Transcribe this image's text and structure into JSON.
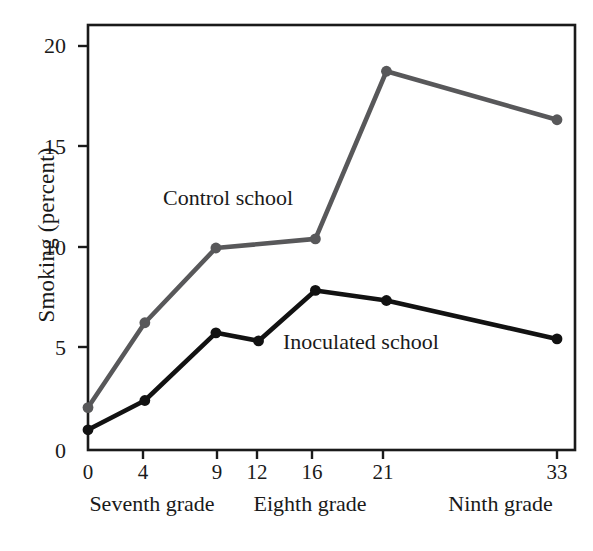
{
  "chart_data": {
    "type": "line",
    "title": "",
    "xlabel": "",
    "ylabel": "Smoking (percent)",
    "x": [
      0,
      4,
      9,
      12,
      16,
      21,
      33
    ],
    "xtick_labels": [
      "0",
      "4",
      "9",
      "12",
      "16",
      "21",
      "33"
    ],
    "ytick_labels": [
      "0",
      "5",
      "10",
      "15",
      "20"
    ],
    "yticks": [
      0,
      5,
      10,
      15,
      20
    ],
    "xlim": [
      0,
      34.3
    ],
    "ylim": [
      0,
      21.0
    ],
    "grid": false,
    "legend_position": "inline-annotation",
    "series": [
      {
        "name": "Control school",
        "color": "#58585a",
        "marker": "circle",
        "x": [
          0,
          4,
          9,
          16,
          21,
          33
        ],
        "values": [
          2.1,
          6.3,
          10.0,
          10.45,
          18.75,
          16.35
        ]
      },
      {
        "name": "Inoculated school",
        "color": "#121212",
        "marker": "circle",
        "x": [
          0,
          4,
          9,
          12,
          16,
          21,
          33
        ],
        "values": [
          1.0,
          2.45,
          5.8,
          5.4,
          7.9,
          7.4,
          5.5
        ]
      }
    ],
    "annotations": [
      {
        "text": "Control school",
        "x_px": 163,
        "y_px": 186
      },
      {
        "text": "Inoculated school",
        "x_px": 283,
        "y_px": 330
      }
    ],
    "x_band_labels": [
      {
        "text": "Seventh grade",
        "center_px": 152
      },
      {
        "text": "Eighth grade",
        "center_px": 310
      },
      {
        "text": "Ninth grade",
        "center_px": 500
      }
    ]
  },
  "axis": {
    "y_title": "Smoking (percent)",
    "y_ticks": [
      "20",
      "15",
      "10",
      "5",
      "0"
    ],
    "x_ticks": [
      "0",
      "4",
      "9",
      "12",
      "16",
      "21",
      "33"
    ],
    "grade_bands": [
      "Seventh grade",
      "Eighth grade",
      "Ninth grade"
    ]
  },
  "annotations": {
    "control": "Control school",
    "inoculated": "Inoculated school"
  },
  "colors": {
    "control_line": "#58585a",
    "inoculated_line": "#121212",
    "frame": "#1a1a1a",
    "background": "#ffffff"
  }
}
